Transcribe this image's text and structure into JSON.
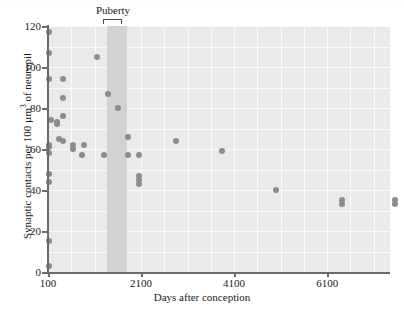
{
  "figure": {
    "background_color": "#ffffff",
    "panel_color": "#eaeaea",
    "grid_color": "#fbfbfb",
    "point_color": "#8c8c8c",
    "band_color": "#d2d2d2",
    "axis_color": "#6a6a6a"
  },
  "annotation": {
    "puberty_label": "Puberty",
    "puberty_start_day": 1360,
    "puberty_end_day": 1800
  },
  "chart_data": {
    "type": "scatter",
    "title": "",
    "xlabel": "Days after conception",
    "ylabel": "Synaptic contacts per 100 µm³ of neuropil",
    "ylabel_parts": {
      "before": "Synaptic contacts per 100 µm",
      "superscript": "3",
      "after": " of neuropil"
    },
    "xlim": [
      100,
      7450
    ],
    "ylim": [
      0,
      120
    ],
    "xticks": [
      100,
      2100,
      4100,
      6100
    ],
    "xtick_labels": [
      "100",
      "2100",
      "4100",
      "6100"
    ],
    "yticks": [
      0,
      20,
      40,
      60,
      80,
      100,
      120
    ],
    "ytick_labels": [
      "0",
      "20",
      "40",
      "60",
      "80",
      "100",
      "120"
    ],
    "grid": true,
    "grid_axis": "both",
    "legend": "none",
    "shaded_regions": [
      {
        "label": "Puberty",
        "x_start": 1360,
        "x_end": 1800
      }
    ],
    "series": [
      {
        "name": "Synaptic contact density",
        "marker": "circle",
        "color": "#8c8c8c",
        "points": [
          {
            "x": 120,
            "y": 117
          },
          {
            "x": 120,
            "y": 107
          },
          {
            "x": 120,
            "y": 94
          },
          {
            "x": 420,
            "y": 94
          },
          {
            "x": 420,
            "y": 85
          },
          {
            "x": 420,
            "y": 76
          },
          {
            "x": 170,
            "y": 74
          },
          {
            "x": 300,
            "y": 73
          },
          {
            "x": 300,
            "y": 72
          },
          {
            "x": 1150,
            "y": 105
          },
          {
            "x": 1400,
            "y": 87
          },
          {
            "x": 1600,
            "y": 80
          },
          {
            "x": 330,
            "y": 65
          },
          {
            "x": 120,
            "y": 62
          },
          {
            "x": 120,
            "y": 61
          },
          {
            "x": 420,
            "y": 64
          },
          {
            "x": 120,
            "y": 58
          },
          {
            "x": 640,
            "y": 60
          },
          {
            "x": 640,
            "y": 62
          },
          {
            "x": 830,
            "y": 57
          },
          {
            "x": 880,
            "y": 62
          },
          {
            "x": 1300,
            "y": 57
          },
          {
            "x": 1830,
            "y": 66
          },
          {
            "x": 1830,
            "y": 57
          },
          {
            "x": 2060,
            "y": 57
          },
          {
            "x": 2060,
            "y": 47
          },
          {
            "x": 2060,
            "y": 45
          },
          {
            "x": 2060,
            "y": 43
          },
          {
            "x": 2860,
            "y": 64
          },
          {
            "x": 3830,
            "y": 59
          },
          {
            "x": 5000,
            "y": 40
          },
          {
            "x": 6420,
            "y": 35
          },
          {
            "x": 6420,
            "y": 33
          },
          {
            "x": 7550,
            "y": 35
          },
          {
            "x": 7550,
            "y": 33
          },
          {
            "x": 120,
            "y": 48
          },
          {
            "x": 120,
            "y": 44
          },
          {
            "x": 120,
            "y": 15
          },
          {
            "x": 120,
            "y": 3
          }
        ]
      }
    ]
  }
}
